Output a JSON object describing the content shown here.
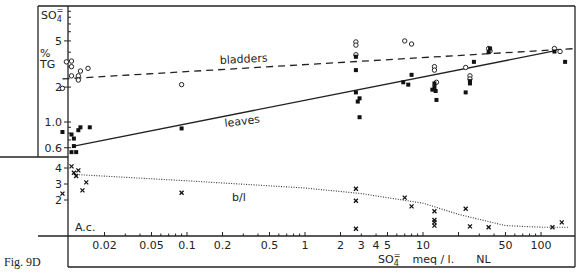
{
  "figure": {
    "label": "Fig. 9D"
  },
  "chart_data": [
    {
      "type": "scatter",
      "title": "",
      "panel": "upper",
      "xlabel": "SO4= meq / l.   NL",
      "ylabel": "SO4= % TG",
      "xscale": "log",
      "yscale": "log",
      "xlim": [
        0.0088,
        200
      ],
      "ylim": [
        0.55,
        6.5
      ],
      "x_ticks": [
        0.02,
        0.05,
        0.1,
        0.2,
        0.5,
        1,
        2,
        3,
        4,
        5,
        10,
        50,
        100
      ],
      "y_ticks": [
        0.6,
        1.0,
        2,
        5
      ],
      "series": [
        {
          "name": "bladders",
          "marker": "open-circle",
          "fit_line": "dashed",
          "fit": {
            "x": [
              0.0088,
              200
            ],
            "y": [
              2.35,
              4.3
            ]
          },
          "points": [
            [
              0.0095,
              3.3
            ],
            [
              0.0105,
              3.35
            ],
            [
              0.0105,
              3.0
            ],
            [
              0.0125,
              2.75
            ],
            [
              0.0105,
              2.5
            ],
            [
              0.012,
              2.5
            ],
            [
              0.012,
              2.3
            ],
            [
              0.0145,
              2.9
            ],
            [
              0.0088,
              1.95
            ],
            [
              0.09,
              2.1
            ],
            [
              2.7,
              4.9
            ],
            [
              2.7,
              4.6
            ],
            [
              2.7,
              3.8
            ],
            [
              7.0,
              5.0
            ],
            [
              8.0,
              4.7
            ],
            [
              12.5,
              3.0
            ],
            [
              12.5,
              2.8
            ],
            [
              13.0,
              2.2
            ],
            [
              23.0,
              2.95
            ],
            [
              25.0,
              2.5
            ],
            [
              25.0,
              2.35
            ],
            [
              36.0,
              4.3
            ],
            [
              37.0,
              4.1
            ],
            [
              130,
              4.3
            ],
            [
              145,
              4.05
            ]
          ]
        },
        {
          "name": "leaves",
          "marker": "filled-square",
          "fit_line": "solid",
          "fit": {
            "x": [
              0.011,
              130
            ],
            "y": [
              0.62,
              4.1
            ]
          },
          "points": [
            [
              0.0088,
              0.82
            ],
            [
              0.0105,
              0.78
            ],
            [
              0.011,
              0.72
            ],
            [
              0.012,
              0.85
            ],
            [
              0.0125,
              0.9
            ],
            [
              0.015,
              0.9
            ],
            [
              0.011,
              0.62
            ],
            [
              0.0105,
              0.55
            ],
            [
              0.0115,
              0.55
            ],
            [
              0.09,
              0.88
            ],
            [
              2.7,
              3.65
            ],
            [
              2.7,
              2.8
            ],
            [
              2.7,
              1.8
            ],
            [
              2.8,
              1.5
            ],
            [
              2.9,
              1.6
            ],
            [
              2.9,
              1.1
            ],
            [
              6.8,
              2.2
            ],
            [
              7.5,
              2.1
            ],
            [
              8.0,
              2.55
            ],
            [
              12.0,
              1.9
            ],
            [
              12.5,
              2.0
            ],
            [
              12.8,
              1.85
            ],
            [
              12.5,
              2.15
            ],
            [
              13.0,
              1.55
            ],
            [
              23.0,
              1.8
            ],
            [
              25.0,
              2.25
            ],
            [
              25.0,
              2.15
            ],
            [
              27.0,
              3.3
            ],
            [
              36.0,
              4.0
            ],
            [
              37.0,
              4.3
            ],
            [
              130,
              4.05
            ],
            [
              160,
              3.3
            ]
          ]
        }
      ]
    },
    {
      "type": "scatter",
      "title": "",
      "panel": "lower",
      "annotation": "A.c.",
      "xlabel": "SO4= meq / l.   NL",
      "ylabel": "b/l",
      "xscale": "log",
      "yscale": "linear",
      "xlim": [
        0.0088,
        200
      ],
      "ylim": [
        0,
        4.5
      ],
      "x_ticks": [
        0.02,
        0.05,
        0.1,
        0.2,
        0.5,
        1,
        2,
        3,
        4,
        5,
        10,
        50,
        100
      ],
      "y_ticks": [
        2,
        3,
        4
      ],
      "series": [
        {
          "name": "b/l",
          "marker": "x",
          "fit_line": "dotted",
          "fit": {
            "x": [
              0.011,
              0.1,
              1,
              3,
              10,
              20,
              50,
              100,
              170
            ],
            "y": [
              3.6,
              3.2,
              2.75,
              2.4,
              1.8,
              1.1,
              0.4,
              0.3,
              0.3
            ]
          },
          "points": [
            [
              0.0088,
              2.4
            ],
            [
              0.0105,
              4.1
            ],
            [
              0.011,
              3.7
            ],
            [
              0.012,
              3.85
            ],
            [
              0.0115,
              3.5
            ],
            [
              0.014,
              3.1
            ],
            [
              0.013,
              2.6
            ],
            [
              0.09,
              2.45
            ],
            [
              2.7,
              2.7
            ],
            [
              2.7,
              1.95
            ],
            [
              2.7,
              0.2
            ],
            [
              7.0,
              2.15
            ],
            [
              8.0,
              1.6
            ],
            [
              12.5,
              1.3
            ],
            [
              12.5,
              0.75
            ],
            [
              12.5,
              0.6
            ],
            [
              12.5,
              0.4
            ],
            [
              23.0,
              1.45
            ],
            [
              25.0,
              0.35
            ],
            [
              36.0,
              0.3
            ],
            [
              125,
              0.3
            ],
            [
              150,
              0.6
            ]
          ]
        }
      ]
    }
  ],
  "labels": {
    "y_upper_title_line1": "SO",
    "y_upper_title_sub": "4",
    "y_upper_title_sup": "=",
    "y_upper_unit_1": "%",
    "y_upper_unit_2": "TG",
    "bladders_label": "bladders",
    "leaves_label": "leaves",
    "bl_label": "b/l",
    "ac_label": "A.c.",
    "x_title_so": "SO",
    "x_title_sub": "4",
    "x_title_sup": "=",
    "x_title_units": "meq / l.",
    "x_title_nl": "NL",
    "y_upper_ticks": [
      {
        "v": 5,
        "t": "5"
      },
      {
        "v": 2,
        "t": "2"
      },
      {
        "v": 1.0,
        "t": "1.0"
      },
      {
        "v": 0.6,
        "t": "0.6"
      }
    ],
    "y_lower_ticks": [
      {
        "v": 4,
        "t": "4"
      },
      {
        "v": 3,
        "t": "3"
      },
      {
        "v": 2,
        "t": "2"
      }
    ],
    "x_ticks": [
      {
        "v": 0.02,
        "t": "0.02"
      },
      {
        "v": 0.05,
        "t": "0.05"
      },
      {
        "v": 0.1,
        "t": "0.1"
      },
      {
        "v": 0.2,
        "t": "0.2"
      },
      {
        "v": 0.5,
        "t": "0.5"
      },
      {
        "v": 1,
        "t": "1"
      },
      {
        "v": 2,
        "t": "2"
      },
      {
        "v": 3,
        "t": "3"
      },
      {
        "v": 4,
        "t": "4"
      },
      {
        "v": 5,
        "t": "5"
      },
      {
        "v": 10,
        "t": "10"
      },
      {
        "v": 50,
        "t": "50"
      },
      {
        "v": 100,
        "t": "100"
      }
    ]
  }
}
